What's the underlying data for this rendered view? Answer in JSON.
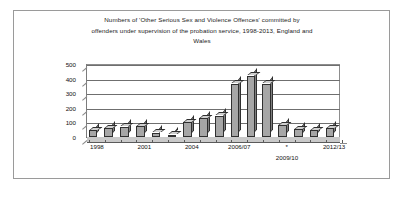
{
  "figure": {
    "title_lines": [
      "Numbers of 'Other Serious Sex and Violence Offences' committed by",
      "offenders under supervision of the probation service, 1998-2013, England and",
      "Wales"
    ],
    "footnote": "2009/10",
    "border_color": "#9a9a9a"
  },
  "chart_data": {
    "type": "bar",
    "title": "Numbers of 'Other Serious Sex and Violence Offences' committed by offenders under supervision of the probation service, 1998-2013, England and Wales",
    "xlabel": "",
    "ylabel": "",
    "ylim": [
      0,
      500
    ],
    "yticks": [
      0,
      100,
      200,
      300,
      400,
      500
    ],
    "ytick_labels": [
      "0",
      "100",
      "200",
      "300",
      "400",
      "500"
    ],
    "grid": true,
    "legend": false,
    "style": "3d-column",
    "bar_fill": "#a6a6a6",
    "bar_edge": "#2f2f2f",
    "categories": [
      "1998",
      "1999",
      "2000",
      "2001",
      "2002",
      "2003",
      "2004",
      "2005",
      "2005/06",
      "2006/07",
      "2007/08",
      "2008/09",
      "2009/10",
      "2010/11",
      "2011/12",
      "2012/13"
    ],
    "values": [
      45,
      62,
      72,
      75,
      30,
      15,
      100,
      130,
      145,
      365,
      420,
      365,
      80,
      55,
      48,
      60
    ],
    "xtick_labels": [
      "1998",
      "2001",
      "2004",
      "2006/07",
      "*",
      "2012/13"
    ],
    "xtick_positions": [
      0,
      3,
      6,
      9,
      12,
      15
    ],
    "annotation": "2009/10"
  }
}
